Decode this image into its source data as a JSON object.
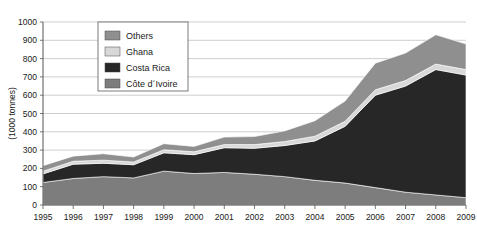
{
  "chart_data": {
    "type": "area",
    "stacked": true,
    "title": "",
    "subtitle": "",
    "xlabel": "",
    "ylabel": "(1000 tonnes)",
    "categories": [
      "1995",
      "1996",
      "1997",
      "1998",
      "1999",
      "2000",
      "2001",
      "2002",
      "2003",
      "2004",
      "2005",
      "2006",
      "2007",
      "2008",
      "2009"
    ],
    "x": [
      1995,
      1996,
      1997,
      1998,
      1999,
      2000,
      2001,
      2002,
      2003,
      2004,
      2005,
      2006,
      2007,
      2008,
      2009
    ],
    "xlim": [
      1995,
      2009
    ],
    "ylim": [
      0,
      1000
    ],
    "yticks": [
      0,
      100,
      200,
      300,
      400,
      500,
      600,
      700,
      800,
      900,
      1000
    ],
    "xticks": [
      "1995",
      "1996",
      "1997",
      "1998",
      "1999",
      "2000",
      "2001",
      "2002",
      "2003",
      "2004",
      "2005",
      "2006",
      "2007",
      "2008",
      "2009"
    ],
    "grid": true,
    "grid_axis": "y",
    "legend_position": "top-left-inside",
    "stack_order_bottom_to_top": [
      "Côte d'Ivoire",
      "Costa Rica",
      "Ghana",
      "Others"
    ],
    "series": [
      {
        "name": "Côte d'Ivoire",
        "color": "#7d7d7d",
        "values": [
          123,
          145,
          155,
          148,
          185,
          172,
          178,
          168,
          155,
          135,
          120,
          95,
          70,
          55,
          40
        ]
      },
      {
        "name": "Costa Rica",
        "color": "#272727",
        "values": [
          47,
          78,
          73,
          72,
          100,
          103,
          135,
          142,
          170,
          215,
          310,
          505,
          580,
          685,
          670
        ]
      },
      {
        "name": "Ghana",
        "color": "#d8d8d8",
        "values": [
          15,
          16,
          17,
          15,
          17,
          16,
          17,
          20,
          22,
          26,
          28,
          30,
          30,
          30,
          30
        ]
      },
      {
        "name": "Others",
        "color": "#8f8f8f",
        "values": [
          30,
          28,
          35,
          27,
          33,
          29,
          41,
          44,
          58,
          84,
          110,
          145,
          150,
          160,
          140
        ]
      }
    ],
    "totals": [
      215,
      267,
      280,
      262,
      335,
      320,
      371,
      374,
      405,
      460,
      568,
      775,
      830,
      930,
      880
    ],
    "legend_entries": [
      {
        "label": "Others",
        "color": "#8f8f8f"
      },
      {
        "label": "Ghana",
        "color": "#d8d8d8"
      },
      {
        "label": "Costa Rica",
        "color": "#272727"
      },
      {
        "label": "Côte d´Ivoire",
        "color": "#7d7d7d"
      }
    ],
    "colors": {
      "others": "#8f8f8f",
      "ghana": "#d8d8d8",
      "costa_rica": "#272727",
      "cote_divoire": "#7d7d7d",
      "grid": "#b9b9b9",
      "axis": "#555555",
      "background": "#ffffff",
      "text": "#1a1a1a"
    }
  }
}
